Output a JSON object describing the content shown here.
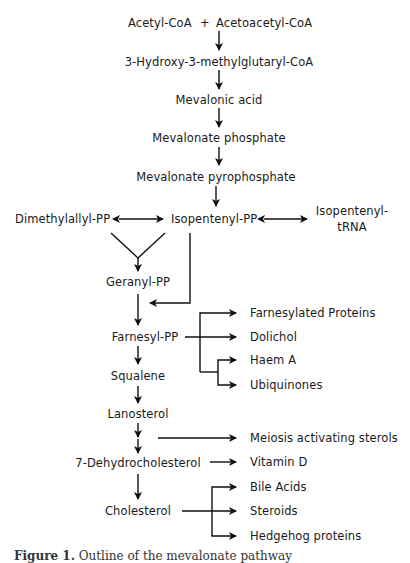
{
  "diagram": {
    "nodes": {
      "acetyl_coa": "Acetyl-CoA",
      "plus": "+",
      "acetoacetyl_coa": "Acetoacetyl-CoA",
      "hmg_coa": "3-Hydroxy-3-methylglutaryl-CoA",
      "mevalonic_acid": "Mevalonic acid",
      "mevalonate_phosphate": "Mevalonate phosphate",
      "mevalonate_pyrophosphate": "Mevalonate pyrophosphate",
      "dimethylallyl_pp": "Dimethylallyl-PP",
      "isopentenyl_pp": "Isopentenyl-PP",
      "isopentenyl_trna_line1": "Isopentenyl-",
      "isopentenyl_trna_line2": "tRNA",
      "geranyl_pp": "Geranyl-PP",
      "farnesyl_pp": "Farnesyl-PP",
      "squalene": "Squalene",
      "lanosterol": "Lanosterol",
      "dehydrocholesterol": "7-Dehydrocholesterol",
      "cholesterol": "Cholesterol"
    },
    "branches": {
      "farnesylated_proteins": "Farnesylated Proteins",
      "dolichol": "Dolichol",
      "haem_a": "Haem A",
      "ubiquinones": "Ubiquinones",
      "meiosis_sterols": "Meiosis activating sterols",
      "vitamin_d": "Vitamin D",
      "bile_acids": "Bile Acids",
      "steroids": "Steroids",
      "hedgehog_proteins": "Hedgehog proteins"
    },
    "edges": [
      {
        "from": "Acetyl-CoA + Acetoacetyl-CoA",
        "to": "3-Hydroxy-3-methylglutaryl-CoA",
        "type": "forward"
      },
      {
        "from": "3-Hydroxy-3-methylglutaryl-CoA",
        "to": "Mevalonic acid",
        "type": "forward"
      },
      {
        "from": "Mevalonic acid",
        "to": "Mevalonate phosphate",
        "type": "forward"
      },
      {
        "from": "Mevalonate phosphate",
        "to": "Mevalonate pyrophosphate",
        "type": "forward"
      },
      {
        "from": "Mevalonate pyrophosphate",
        "to": "Isopentenyl-PP",
        "type": "forward"
      },
      {
        "from": "Dimethylallyl-PP",
        "to": "Isopentenyl-PP",
        "type": "bidirectional"
      },
      {
        "from": "Isopentenyl-PP",
        "to": "Isopentenyl-tRNA",
        "type": "bidirectional"
      },
      {
        "from": "Dimethylallyl-PP + Isopentenyl-PP",
        "to": "Geranyl-PP",
        "type": "merge"
      },
      {
        "from": "Geranyl-PP",
        "to": "Farnesyl-PP",
        "type": "forward"
      },
      {
        "from": "Isopentenyl-PP",
        "to": "Farnesyl-PP",
        "type": "forward"
      },
      {
        "from": "Farnesyl-PP",
        "to": "Farnesylated Proteins",
        "type": "branch"
      },
      {
        "from": "Farnesyl-PP",
        "to": "Dolichol",
        "type": "branch"
      },
      {
        "from": "Farnesyl-PP",
        "to": "Haem A",
        "type": "branch"
      },
      {
        "from": "Farnesyl-PP",
        "to": "Ubiquinones",
        "type": "branch"
      },
      {
        "from": "Farnesyl-PP",
        "to": "Squalene",
        "type": "forward"
      },
      {
        "from": "Squalene",
        "to": "Lanosterol",
        "type": "forward"
      },
      {
        "from": "Lanosterol",
        "to": "7-Dehydrocholesterol",
        "type": "forward (two steps)"
      },
      {
        "from": "Lanosterol pathway",
        "to": "Meiosis activating sterols",
        "type": "branch"
      },
      {
        "from": "7-Dehydrocholesterol",
        "to": "Vitamin D",
        "type": "branch"
      },
      {
        "from": "7-Dehydrocholesterol",
        "to": "Cholesterol",
        "type": "forward"
      },
      {
        "from": "Cholesterol",
        "to": "Bile Acids",
        "type": "branch"
      },
      {
        "from": "Cholesterol",
        "to": "Steroids",
        "type": "branch"
      },
      {
        "from": "Cholesterol",
        "to": "Hedgehog proteins",
        "type": "branch"
      }
    ]
  },
  "caption": {
    "label": "Figure 1.",
    "text": "Outline of the mevalonate pathway"
  }
}
